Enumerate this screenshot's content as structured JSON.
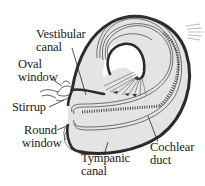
{
  "diagram": {
    "labels": {
      "vestibular_canal": {
        "line1": "Vestibular",
        "line2": "canal"
      },
      "oval_window": {
        "line1": "Oval",
        "line2": "window"
      },
      "stirrup": {
        "line1": "Stirrup"
      },
      "round_window": {
        "line1": "Round",
        "line2": "window"
      },
      "tympanic_canal": {
        "line1": "Tympanic",
        "line2": "canal"
      },
      "cochlear_duct": {
        "line1": "Cochlear",
        "line2": "duct"
      }
    },
    "colors": {
      "outline": "#2b2b2b",
      "fill": "#e4e4e4",
      "inner_fill": "#f2f2f2",
      "text": "#1a1a1a",
      "background": "#ffffff"
    }
  }
}
